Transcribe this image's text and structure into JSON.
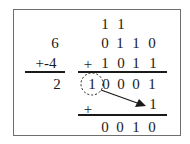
{
  "decimal": {
    "operand1": "6",
    "operand2": "+-4",
    "result": "2"
  },
  "binary": {
    "carries": [
      "1",
      "1"
    ],
    "operand1": [
      "0",
      "1",
      "1",
      "0"
    ],
    "operand2_sign": "+",
    "operand2": [
      "1",
      "0",
      "1",
      "1"
    ],
    "intermediate_overflow": "1",
    "intermediate": [
      "0",
      "0",
      "0",
      "1"
    ],
    "end_around_sign": "+",
    "end_around_carry": "1",
    "result": [
      "0",
      "0",
      "1",
      "0"
    ]
  },
  "colors": {
    "border": "#6e6e6e",
    "ink": "#1a1a1a"
  }
}
